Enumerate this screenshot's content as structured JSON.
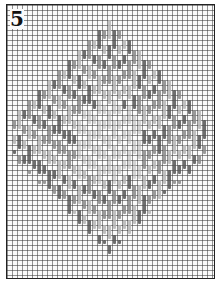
{
  "figure": {
    "label": "5",
    "type": "bargello needlepoint chart",
    "grid": {
      "cell_px": 5,
      "columns": 41,
      "rows": 54
    },
    "pattern": {
      "shape": "diamond / flame medallion",
      "center_col": 20,
      "top_row": 6,
      "bottom_row": 47,
      "max_half_width": 19,
      "colors": {
        "dark": "#555555",
        "mid": "#888888",
        "light": "#b5b5b5",
        "grid": "#3c3c3c",
        "background": "#fafafa"
      }
    }
  }
}
